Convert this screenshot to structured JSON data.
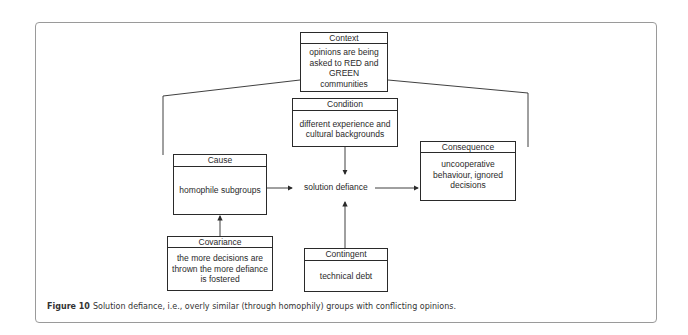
{
  "diagram": {
    "context": {
      "title": "Context",
      "text": "opinions are being asked to RED and GREEN communities"
    },
    "condition": {
      "title": "Condition",
      "text": "different experience and cultural backgrounds"
    },
    "cause": {
      "title": "Cause",
      "text": "homophile subgroups"
    },
    "phenomenon": {
      "text": "solution defiance"
    },
    "consequence": {
      "title": "Consequence",
      "text": "uncooperative behaviour, ignored decisions"
    },
    "covariance": {
      "title": "Covariance",
      "text": "the more decisions are thrown the more defiance is fostered"
    },
    "contingent": {
      "title": "Contingent",
      "text": "technical debt"
    },
    "edges": [
      {
        "from": "cause",
        "to": "phenomenon"
      },
      {
        "from": "phenomenon",
        "to": "consequence"
      },
      {
        "from": "condition",
        "to": "phenomenon"
      },
      {
        "from": "contingent",
        "to": "phenomenon"
      },
      {
        "from": "covariance",
        "to": "cause"
      },
      {
        "from": "context",
        "to": "cause",
        "style": "bracket"
      },
      {
        "from": "context",
        "to": "consequence",
        "style": "bracket"
      }
    ],
    "colors": {
      "line": "#2a2a2a",
      "frame": "#9a9a9a"
    }
  },
  "caption": {
    "label": "Figure 10",
    "text": "Solution defiance, i.e., overly similar (through homophily) groups with conflicting opinions."
  }
}
